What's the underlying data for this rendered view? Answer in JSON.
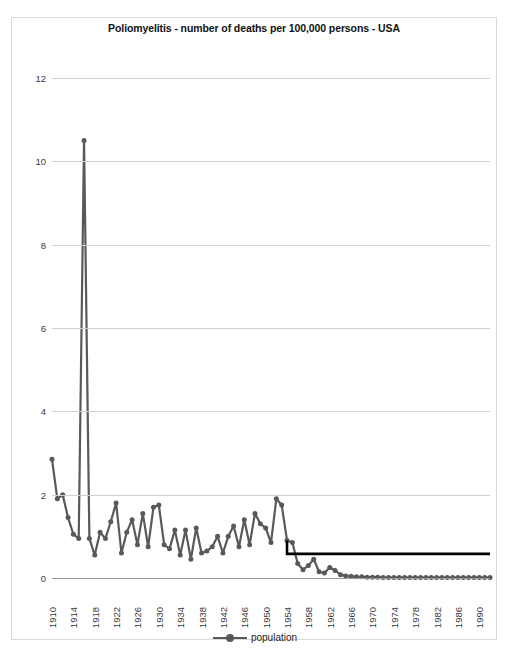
{
  "chart_data": {
    "type": "line",
    "title": "Poliomyelitis - number of deaths per 100,000  persons - USA",
    "xlabel": "",
    "ylabel": "",
    "ylim": [
      0,
      12
    ],
    "yticks": [
      0,
      2,
      4,
      6,
      8,
      10,
      12
    ],
    "xlim": [
      1910,
      1992
    ],
    "xticks": [
      1910,
      1914,
      1918,
      1922,
      1926,
      1930,
      1934,
      1938,
      1942,
      1946,
      1950,
      1954,
      1958,
      1962,
      1966,
      1970,
      1974,
      1978,
      1982,
      1986,
      1990
    ],
    "grid": true,
    "legend_position": "bottom",
    "series": [
      {
        "name": "population",
        "color": "#595959",
        "marker": "circle",
        "x": [
          1910,
          1911,
          1912,
          1913,
          1914,
          1915,
          1916,
          1917,
          1918,
          1919,
          1920,
          1921,
          1922,
          1923,
          1924,
          1925,
          1926,
          1927,
          1928,
          1929,
          1930,
          1931,
          1932,
          1933,
          1934,
          1935,
          1936,
          1937,
          1938,
          1939,
          1940,
          1941,
          1942,
          1943,
          1944,
          1945,
          1946,
          1947,
          1948,
          1949,
          1950,
          1951,
          1952,
          1953,
          1954,
          1955,
          1956,
          1957,
          1958,
          1959,
          1960,
          1961,
          1962,
          1963,
          1964,
          1965,
          1966,
          1967,
          1968,
          1969,
          1970,
          1971,
          1972,
          1973,
          1974,
          1975,
          1976,
          1977,
          1978,
          1979,
          1980,
          1981,
          1982,
          1983,
          1984,
          1985,
          1986,
          1987,
          1988,
          1989,
          1990,
          1991,
          1992
        ],
        "y": [
          2.85,
          1.9,
          2.0,
          1.45,
          1.05,
          0.95,
          10.5,
          0.95,
          0.55,
          1.1,
          0.95,
          1.35,
          1.8,
          0.6,
          1.1,
          1.4,
          0.8,
          1.55,
          0.75,
          1.7,
          1.75,
          0.8,
          0.7,
          1.15,
          0.55,
          1.15,
          0.45,
          1.2,
          0.6,
          0.65,
          0.75,
          1.0,
          0.6,
          1.0,
          1.25,
          0.75,
          1.4,
          0.8,
          1.55,
          1.3,
          1.2,
          0.85,
          1.9,
          1.75,
          0.9,
          0.85,
          0.35,
          0.2,
          0.3,
          0.45,
          0.15,
          0.12,
          0.25,
          0.18,
          0.08,
          0.05,
          0.04,
          0.03,
          0.03,
          0.02,
          0.02,
          0.02,
          0.01,
          0.01,
          0.01,
          0.01,
          0.01,
          0.01,
          0.01,
          0.01,
          0.01,
          0.01,
          0.01,
          0.01,
          0.01,
          0.01,
          0.01,
          0.01,
          0.01,
          0.01,
          0.01,
          0.01,
          0.01
        ]
      }
    ],
    "annotation_line": {
      "name": "vaccine-introduction-marker",
      "color": "#000000",
      "x_start": 1954,
      "x_end": 1992,
      "y_level": 0.58,
      "y_top": 0.9
    },
    "legend": [
      {
        "label": "population"
      }
    ]
  }
}
